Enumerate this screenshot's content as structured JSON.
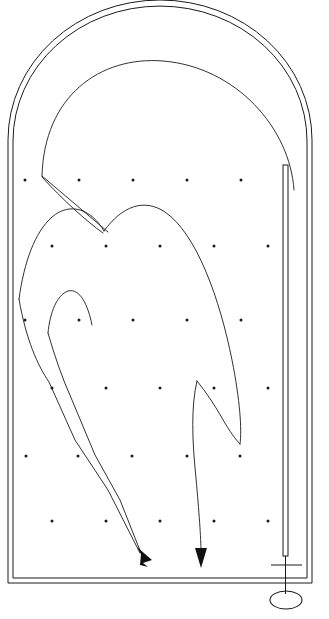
{
  "figure": {
    "background_color": "#ffffff",
    "line_color": "#1a1a1a",
    "width": 329,
    "height": 619
  },
  "enclosure": {
    "name": "arched-chamber-outline",
    "style": "double-line wall",
    "outer_path": "M 8,583 L 8,140 A 152,140 0 0 1 312,140 L 312,583 Z",
    "inner_path": "M 13,578 L 13,141 A 146,134 0 0 1 307,141 L 307,578 Z",
    "left_wall_x": [
      8,
      13
    ],
    "right_wall_x": [
      307,
      312
    ],
    "floor_y": [
      578,
      583
    ],
    "arch_apex_y": 8
  },
  "inner_arc": {
    "name": "inner-dome-arc",
    "path": "M 42,176 C 44,96 100,56 163,61 C 236,67 290,128 294,190"
  },
  "rod": {
    "name": "vertical-rod",
    "x_left": 283,
    "x_right": 288,
    "top_y": 165,
    "bottom_y": 556,
    "stem_path": "M 285.5,556 L 285.5,594",
    "crossbar": {
      "x1": 271,
      "x2": 302,
      "y": 565
    },
    "base_ellipse": {
      "cx": 286,
      "cy": 600,
      "rx": 16,
      "ry": 9
    }
  },
  "dot_grid": {
    "name": "field-point-grid",
    "rows": [
      {
        "y": 180,
        "xs": [
          25,
          79,
          133,
          187,
          241
        ]
      },
      {
        "y": 246,
        "xs": [
          52,
          106,
          160,
          214,
          268
        ]
      },
      {
        "y": 320,
        "xs": [
          25,
          79,
          133,
          187,
          241
        ]
      },
      {
        "y": 388,
        "xs": [
          52,
          106,
          160,
          214,
          268
        ]
      },
      {
        "y": 456,
        "xs": [
          26,
          78,
          132,
          187,
          240
        ]
      },
      {
        "y": 521,
        "xs": [
          52,
          106,
          160,
          214,
          268
        ]
      }
    ],
    "dot_radius": 1.5
  },
  "flux_lines": [
    {
      "name": "cusp-tail-upper",
      "path": "M 42,176 L 108,232"
    },
    {
      "name": "cusp-tail-lower",
      "path": "M 42,177 C 62,199 86,221 103,233"
    },
    {
      "name": "left-lobe-outer",
      "path": "M 19,299 C 24,262 35,232 52,217 C 71,201 92,210 104,231"
    },
    {
      "name": "left-lobe-inner",
      "path": "M 48,333 C 50,312 57,295 68,291 C 80,288 88,305 92,325"
    },
    {
      "name": "main-descent-left",
      "path": "M 19,299 C 26,340 38,366 49,382 L 75,440 L 108,490 L 140,553"
    },
    {
      "name": "second-lobe-left",
      "path": "M 48,333 C 54,354 62,378 72,400 L 95,455 L 120,500 L 141,553"
    },
    {
      "name": "central-dome",
      "path": "M 104,231 C 122,206 144,198 165,212 C 197,234 220,300 232,360 C 240,400 242,430 240,444"
    },
    {
      "name": "right-lobe-outer",
      "path": "M 197,381 C 206,392 214,404 222,418 C 230,432 236,440 240,444"
    },
    {
      "name": "right-descent",
      "path": "M 197,381 C 191,406 192,440 196,478 C 199,512 201,538 201,552"
    }
  ],
  "arrows": [
    {
      "name": "flux-arrow-left",
      "tip": {
        "x": 147,
        "y": 566
      },
      "direction": "down-right",
      "polygon": "137,547 152,560 143,563 148,567 140,565 141,554"
    },
    {
      "name": "flux-arrow-right",
      "tip": {
        "x": 201,
        "y": 567
      },
      "direction": "down",
      "polygon": "195,548 207,548 201,568"
    }
  ]
}
